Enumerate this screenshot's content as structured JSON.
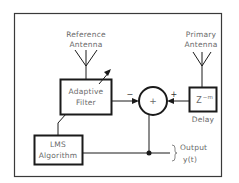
{
  "diagram": {
    "reference_antenna": {
      "line1": "Reference",
      "line2": "Antenna"
    },
    "primary_antenna": {
      "line1": "Primary",
      "line2": "Antenna"
    },
    "adaptive_filter": {
      "line1": "Adaptive",
      "line2": "Filter"
    },
    "summing_junction": {
      "symbol": "+",
      "left_sign": "−",
      "right_sign": "+"
    },
    "delay": {
      "symbol": "Z",
      "exponent": "−m",
      "label": "Delay"
    },
    "lms": {
      "line1": "LMS",
      "line2": "Algorithm"
    },
    "output": {
      "line1": "Output",
      "line2": "y(t)"
    },
    "colors": {
      "stroke": "#1a1a1a",
      "frame": "#3a3a3a",
      "text": "#6a6a6a",
      "background": "#ffffff"
    }
  }
}
